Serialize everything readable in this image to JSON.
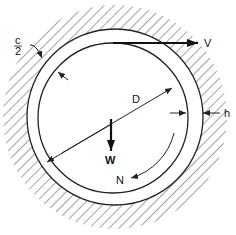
{
  "diagram": {
    "labels": {
      "clearance_num": "c",
      "clearance_den": "2",
      "velocity": "V",
      "diameter": "D",
      "film_thickness": "h",
      "load": "W",
      "rotation": "N"
    },
    "colors": {
      "line": "#222222",
      "hatch": "#555555",
      "background": "#ffffff"
    }
  }
}
